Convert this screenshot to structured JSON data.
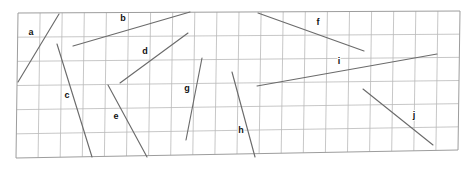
{
  "figure": {
    "width": 467,
    "height": 169,
    "background_color": "#ffffff",
    "grid": {
      "line_color": "#b9b9b9",
      "border_color": "#9d9d9d",
      "columns": 20,
      "rows": 6,
      "corners": {
        "top_left": [
          18,
          13
        ],
        "top_right": [
          460,
          11
        ],
        "bottom_right": [
          458,
          150
        ],
        "bottom_left": [
          16,
          158
        ]
      }
    },
    "segment_color": "#6b6b6b",
    "label_color": "#111111",
    "segments": [
      {
        "id": "a",
        "label": "a",
        "x1": 18,
        "y1": 82,
        "x2": 59,
        "y2": 14,
        "label_x": 31,
        "label_y": 33
      },
      {
        "id": "b",
        "label": "b",
        "x1": 73,
        "y1": 46,
        "x2": 190,
        "y2": 12,
        "label_x": 123,
        "label_y": 19
      },
      {
        "id": "d",
        "label": "d",
        "x1": 120,
        "y1": 83,
        "x2": 188,
        "y2": 33,
        "label_x": 145,
        "label_y": 52
      },
      {
        "id": "c",
        "label": "c",
        "x1": 57,
        "y1": 44,
        "x2": 92,
        "y2": 157,
        "label_x": 67,
        "label_y": 96
      },
      {
        "id": "e",
        "label": "e",
        "x1": 108,
        "y1": 85,
        "x2": 147,
        "y2": 157,
        "label_x": 116,
        "label_y": 117
      },
      {
        "id": "g",
        "label": "g",
        "x1": 202,
        "y1": 58,
        "x2": 186,
        "y2": 140,
        "label_x": 187,
        "label_y": 89
      },
      {
        "id": "f",
        "label": "f",
        "x1": 258,
        "y1": 13,
        "x2": 364,
        "y2": 51,
        "label_x": 318,
        "label_y": 23
      },
      {
        "id": "i",
        "label": "i",
        "x1": 257,
        "y1": 86,
        "x2": 437,
        "y2": 54,
        "label_x": 339,
        "label_y": 62
      },
      {
        "id": "h",
        "label": "h",
        "x1": 232,
        "y1": 72,
        "x2": 255,
        "y2": 157,
        "label_x": 241,
        "label_y": 131
      },
      {
        "id": "j",
        "label": "j",
        "x1": 363,
        "y1": 89,
        "x2": 433,
        "y2": 145,
        "label_x": 414,
        "label_y": 116
      }
    ]
  }
}
